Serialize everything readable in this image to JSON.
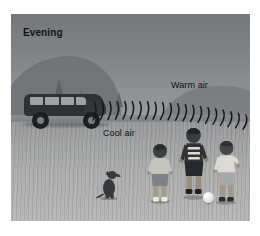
{
  "figure": {
    "caption_label": "Evening",
    "scene_description": "Evening scene: sound waves from a parked van refract downward through warm air above cool air toward children playing soccer"
  },
  "labels": {
    "time_of_day": "Evening",
    "upper_air": "Warm air",
    "lower_air": "Cool air"
  },
  "objects": {
    "vehicle": "minivan",
    "dog": "sitting-dog",
    "ball": "soccer-ball",
    "children": [
      {
        "name": "child-left"
      },
      {
        "name": "child-middle"
      },
      {
        "name": "child-right"
      }
    ],
    "trees": [
      {
        "name": "tree-1"
      },
      {
        "name": "tree-2"
      },
      {
        "name": "tree-3"
      }
    ]
  },
  "waves": {
    "arc_count": 21,
    "direction": "left-to-right",
    "curvature": "downward"
  },
  "colors": {
    "sky_top": "#75777b",
    "sky_bottom": "#9a9b9d",
    "ground_near": "#b7b7b6",
    "ground_far": "#98999b",
    "vehicle": "#2f3134",
    "label_text": "#111214",
    "wave_stroke": "#15171a",
    "frame_background": "#ffffff"
  }
}
